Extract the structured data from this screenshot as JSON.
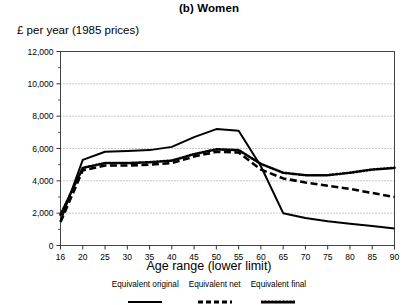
{
  "chart_data": {
    "type": "line",
    "title": "(b) Women",
    "subtitle": "",
    "ylabel": "£ per year (1985 prices)",
    "xlabel": "Age range (lower limit)",
    "xlim": [
      16,
      90
    ],
    "ylim": [
      0,
      12000
    ],
    "grid": true,
    "grid_axis": "y",
    "legend_position": "bottom",
    "ytick_labels": [
      "0",
      "2,000",
      "4,000",
      "6,000",
      "8,000",
      "10,000",
      "12,000"
    ],
    "ytick_values": [
      0,
      2000,
      4000,
      6000,
      8000,
      10000,
      12000
    ],
    "xtick_labels": [
      "16",
      "20",
      "25",
      "30",
      "35",
      "40",
      "45",
      "50",
      "55",
      "60",
      "65",
      "70",
      "75",
      "80",
      "85",
      "90"
    ],
    "x": [
      16,
      20,
      25,
      30,
      35,
      40,
      45,
      50,
      55,
      60,
      65,
      70,
      75,
      80,
      85,
      90
    ],
    "series": [
      {
        "name": "Equivalent original",
        "style": "solid",
        "color": "#000000",
        "values": [
          1500,
          5300,
          5800,
          5850,
          5900,
          6100,
          6700,
          7200,
          7100,
          4900,
          2000,
          1700,
          1500,
          1350,
          1200,
          1050
        ]
      },
      {
        "name": "Equivalent net",
        "style": "dashed",
        "color": "#000000",
        "values": [
          1450,
          4650,
          4950,
          4950,
          5000,
          5100,
          5500,
          5800,
          5750,
          4700,
          4150,
          3900,
          3700,
          3500,
          3250,
          3000
        ]
      },
      {
        "name": "Equivalent final",
        "style": "dotted",
        "color": "#000000",
        "values": [
          1900,
          4800,
          5100,
          5100,
          5150,
          5250,
          5650,
          5950,
          5900,
          5050,
          4500,
          4350,
          4350,
          4500,
          4700,
          4800
        ]
      }
    ]
  },
  "legend": {
    "entries": [
      {
        "label": "Equivalent original",
        "style": "solid"
      },
      {
        "label": "Equivalent net",
        "style": "dashed"
      },
      {
        "label": "Equivalent final",
        "style": "dotted"
      }
    ]
  }
}
